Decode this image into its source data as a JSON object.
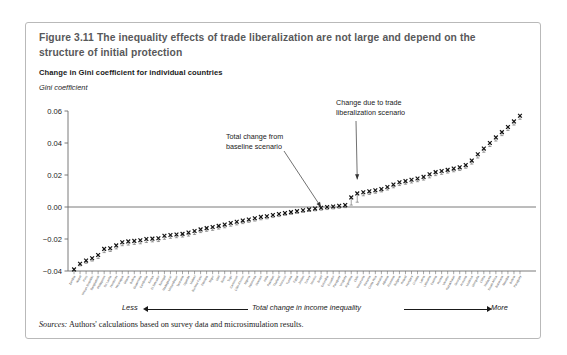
{
  "figure": {
    "title": "Figure 3.11  The inequality effects of trade liberalization are not large and depend on the structure of initial protection",
    "subtitle": "Change in Gini coefficient for individual countries",
    "sources_label": "Sources:",
    "sources_text": " Authors' calculations based on survey data and microsimulation results."
  },
  "axis_footer": {
    "less_label": "Less",
    "more_label": "More",
    "center_label": "Total change in income inequality"
  },
  "chart_data": {
    "type": "scatter",
    "title": "Change in Gini coefficient for individual countries",
    "xlabel": "Total change in income inequality",
    "ylabel": "Gini coefficient",
    "ylim": [
      -0.04,
      0.06
    ],
    "yticks": [
      -0.04,
      -0.02,
      0.0,
      0.02,
      0.04,
      0.06
    ],
    "ytick_labels": [
      "−0.04",
      "−0.02",
      "0.00",
      "0.02",
      "0.04",
      "0.06"
    ],
    "grid": false,
    "zero_line": true,
    "marker": "x-cross",
    "error_bars": true,
    "legend_position": "none",
    "annotations": [
      {
        "text": "Total change from baseline scenario",
        "lines": [
          "Total change from",
          "baseline scenario"
        ],
        "target_index": 41
      },
      {
        "text": "Change due to trade liberalization scenario",
        "lines": [
          "Change due to trade",
          "liberalization scenario"
        ],
        "target_index": 47
      }
    ],
    "categories": [
      "Zambia",
      "Nepal",
      "Peru",
      "Dominican Republic",
      "Bangladesh",
      "Philippines",
      "Sri Lanka",
      "Honduras",
      "Nicaragua",
      "Ghana",
      "Bolivia",
      "Guatemala",
      "Cambodia",
      "Kenya",
      "El Salvador",
      "Senegal",
      "Madagascar",
      "Mozambique",
      "Tanzania",
      "Uganda",
      "Malawi",
      "Burkina Faso",
      "Ethiopia",
      "Niger",
      "Mali",
      "Benin",
      "Togo",
      "Cameroon",
      "Côte d'Ivoire",
      "Nigeria",
      "Indonesia",
      "Vietnam",
      "India",
      "Pakistan",
      "Thailand",
      "Morocco",
      "Tunisia",
      "Egypt",
      "Jordan",
      "Turkey",
      "Mexico",
      "Brazil",
      "Colombia",
      "Ecuador",
      "Paraguay",
      "Uruguay",
      "Argentina",
      "Chile",
      "Venezuela",
      "Panama",
      "Costa Rica",
      "Jamaica",
      "Albania",
      "Romania",
      "Bulgaria",
      "Poland",
      "Hungary",
      "Croatia",
      "Latvia",
      "Lithuania",
      "Estonia",
      "Russia",
      "Ukraine",
      "Kazakhstan",
      "Georgia",
      "Armenia",
      "Moldova",
      "Mongolia",
      "China",
      "Malaysia",
      "South Africa",
      "Botswana",
      "Namibia",
      "Bolivia",
      "Paraguay"
    ],
    "values": [
      -0.039,
      -0.0355,
      -0.0335,
      -0.032,
      -0.03,
      -0.0262,
      -0.0258,
      -0.024,
      -0.022,
      -0.0215,
      -0.0212,
      -0.0208,
      -0.02,
      -0.0198,
      -0.0195,
      -0.018,
      -0.0175,
      -0.0172,
      -0.0168,
      -0.016,
      -0.015,
      -0.014,
      -0.0132,
      -0.0125,
      -0.0118,
      -0.011,
      -0.01,
      -0.0092,
      -0.0085,
      -0.0078,
      -0.007,
      -0.0062,
      -0.0058,
      -0.005,
      -0.0044,
      -0.0038,
      -0.0032,
      -0.0026,
      -0.002,
      -0.0015,
      -0.001,
      -0.0005,
      0.0,
      0.0003,
      0.0008,
      0.0012,
      0.006,
      0.0085,
      0.0092,
      0.0098,
      0.0105,
      0.0112,
      0.0125,
      0.014,
      0.0155,
      0.0162,
      0.017,
      0.0178,
      0.0188,
      0.0205,
      0.0218,
      0.0225,
      0.0232,
      0.024,
      0.0248,
      0.0262,
      0.029,
      0.033,
      0.0365,
      0.04,
      0.0435,
      0.0468,
      0.05,
      0.0535,
      0.057
    ],
    "baseline_values": [
      -0.0398,
      -0.0368,
      -0.0352,
      -0.0338,
      -0.0322,
      -0.0285,
      -0.0278,
      -0.0262,
      -0.0242,
      -0.0238,
      -0.0234,
      -0.023,
      -0.0222,
      -0.0218,
      -0.0216,
      -0.0202,
      -0.0196,
      -0.0192,
      -0.0188,
      -0.0182,
      -0.0172,
      -0.016,
      -0.0152,
      -0.0146,
      -0.0138,
      -0.013,
      -0.012,
      -0.0112,
      -0.0104,
      -0.0096,
      -0.0088,
      -0.008,
      -0.0074,
      -0.0066,
      -0.006,
      -0.0052,
      -0.0046,
      -0.004,
      -0.0034,
      -0.0028,
      -0.0024,
      -0.002,
      -0.0016,
      -0.0012,
      -0.0008,
      -0.0004,
      0.0012,
      0.003,
      0.007,
      0.0078,
      0.0086,
      0.0094,
      0.0106,
      0.012,
      0.0134,
      0.0142,
      0.015,
      0.0158,
      0.0168,
      0.0182,
      0.0196,
      0.0204,
      0.0212,
      0.022,
      0.0228,
      0.0242,
      0.0268,
      0.0306,
      0.0342,
      0.0378,
      0.0412,
      0.0446,
      0.0478,
      0.0512,
      0.0548
    ]
  }
}
